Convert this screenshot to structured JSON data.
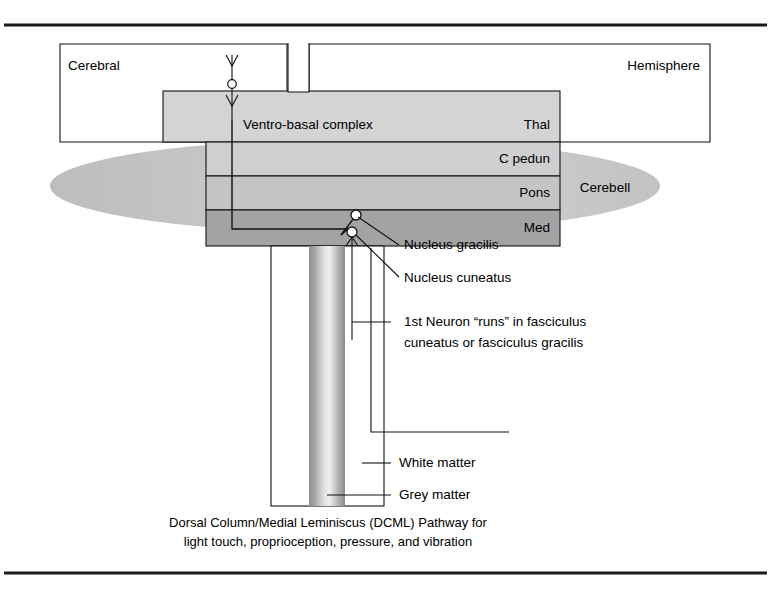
{
  "figure": {
    "caption_line1": "Dorsal Column/Medial Leminiscus (DCML) Pathway for",
    "caption_line2": "light touch, proprioception, pressure, and vibration"
  },
  "structures": {
    "cerebral": "Cerebral",
    "hemisphere": "Hemisphere",
    "ventro_basal_complex": "Ventro-basal complex",
    "thalamus": "Thal",
    "cerebral_peduncle": "C pedun",
    "pons": "Pons",
    "medulla": "Med",
    "cerebellum": "Cerebell"
  },
  "annotations": {
    "nucleus_gracilis": "Nucleus gracilis",
    "nucleus_cuneatus": "Nucleus cuneatus",
    "first_neuron_line1": "1st Neuron “runs” in fasciculus",
    "first_neuron_line2": "cuneatus or fasciculus gracilis",
    "white_matter": "White matter",
    "grey_matter": "Grey matter"
  },
  "colors": {
    "ink": "#111111",
    "page": "#ffffff",
    "thalamus_fill": "#d4d4d4",
    "peduncle_fill": "#cfcfcf",
    "pons_fill": "#c4c4c4",
    "medulla_fill": "#a3a3a3",
    "cerebellum_fill": "#c9c9c9",
    "grey_matter_fill": "#b5b5b5"
  }
}
